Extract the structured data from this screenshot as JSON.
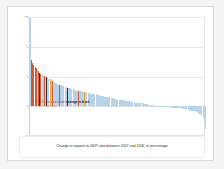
{
  "slide": {
    "background_color": "#f4f4f4",
    "card_background": "#ffffff",
    "card_border_color": "#d9d9d9"
  },
  "legend": {
    "line1_prefix": "EU11 countries in ",
    "line1_red": "red",
    "line1_mid": ", ",
    "line1_black": "average in black",
    "line2": "EU c. in orange",
    "red_color": "#c0392b",
    "black_color": "#1a1a1a",
    "orange_color": "#e8a33d"
  },
  "caption": {
    "text": "Change in exports to GDP ratio between 2017 and 2000, in percentage"
  },
  "chart_data": {
    "type": "bar",
    "title": "",
    "subtitle": "",
    "xlabel": "",
    "ylabel": "",
    "ylim": [
      -40,
      120
    ],
    "yticks": [
      120,
      80,
      40,
      0,
      -40
    ],
    "ytick_labels": [
      "120",
      "80",
      "40",
      "0",
      "-40"
    ],
    "grid": true,
    "grid_axis": "y",
    "legend_position": "inside-left",
    "sorted": "descending",
    "note": "Sorted change in exports-to-GDP ratio across ~150 economies; EU11 highlighted red, EU average black, EU candidate orange, all other economies light blue.",
    "colors": {
      "other": "#b8d2ea",
      "eu11": "#cf5b3a",
      "average": "#333333",
      "candidate": "#e8a33d"
    },
    "series": [
      {
        "name": "Change in exports to GDP ratio 2000-2017",
        "categories": [
          "c1",
          "c2",
          "c3",
          "c4",
          "c5",
          "c6",
          "c7",
          "c8",
          "c9",
          "c10",
          "c11",
          "c12",
          "c13",
          "c14",
          "c15",
          "c16",
          "c17",
          "c18",
          "c19",
          "c20",
          "c21",
          "c22",
          "c23",
          "c24",
          "c25",
          "c26",
          "c27",
          "c28",
          "c29",
          "c30",
          "c31",
          "c32",
          "c33",
          "c34",
          "c35",
          "c36",
          "c37",
          "c38",
          "c39",
          "c40",
          "c41",
          "c42",
          "c43",
          "c44",
          "c45",
          "c46",
          "c47",
          "c48",
          "c49",
          "c50",
          "c51",
          "c52",
          "c53",
          "c54",
          "c55",
          "c56",
          "c57",
          "c58",
          "c59",
          "c60",
          "c61",
          "c62",
          "c63",
          "c64",
          "c65",
          "c66",
          "c67",
          "c68",
          "c69",
          "c70",
          "c71",
          "c72",
          "c73",
          "c74",
          "c75",
          "c76",
          "c77",
          "c78",
          "c79",
          "c80",
          "c81",
          "c82",
          "c83",
          "c84",
          "c85",
          "c86",
          "c87",
          "c88",
          "c89",
          "c90",
          "c91",
          "c92",
          "c93",
          "c94",
          "c95",
          "c96",
          "c97",
          "c98",
          "c99",
          "c100",
          "c101",
          "c102",
          "c103",
          "c104",
          "c105",
          "c106",
          "c107",
          "c108",
          "c109",
          "c110",
          "c111",
          "c112",
          "c113",
          "c114",
          "c115",
          "c116",
          "c117",
          "c118",
          "c119",
          "c120",
          "c121",
          "c122",
          "c123",
          "c124",
          "c125",
          "c126",
          "c127",
          "c128",
          "c129",
          "c130",
          "c131",
          "c132",
          "c133",
          "c134",
          "c135",
          "c136",
          "c137",
          "c138",
          "c139",
          "c140",
          "c141",
          "c142",
          "c143",
          "c144",
          "c145",
          "c146",
          "c147",
          "c148",
          "c149",
          "c150"
        ],
        "values": [
          118,
          62,
          58,
          55,
          53,
          51,
          49,
          47,
          45,
          44,
          43,
          42,
          41,
          40,
          39,
          38,
          37,
          36,
          35,
          34,
          33,
          32,
          31,
          30,
          29,
          29,
          28,
          28,
          27,
          27,
          26,
          26,
          25,
          25,
          24,
          24,
          23,
          23,
          22,
          22,
          21,
          21,
          21,
          20,
          20,
          20,
          19,
          19,
          19,
          18,
          18,
          18,
          17,
          17,
          17,
          16,
          16,
          16,
          15,
          15,
          15,
          14,
          14,
          14,
          13,
          13,
          13,
          12,
          12,
          12,
          11,
          11,
          11,
          10,
          10,
          10,
          9,
          9,
          9,
          8,
          8,
          8,
          8,
          7,
          7,
          7,
          7,
          6,
          6,
          6,
          6,
          5,
          5,
          5,
          5,
          4,
          4,
          4,
          4,
          3,
          3,
          3,
          3,
          2,
          2,
          2,
          2,
          2,
          1,
          1,
          1,
          1,
          1,
          0,
          0,
          0,
          0,
          0,
          -1,
          -1,
          -1,
          -1,
          -1,
          -2,
          -2,
          -2,
          -2,
          -2,
          -3,
          -3,
          -3,
          -3,
          -4,
          -4,
          -4,
          -4,
          -5,
          -5,
          -5,
          -6,
          -6,
          -6,
          -7,
          -7,
          -8,
          -8,
          -9,
          -10,
          -11,
          -13,
          -16,
          -21,
          -30
        ],
        "kinds": [
          "other",
          "eu11",
          "eu11",
          "eu11",
          "eu11",
          "eu11",
          "other",
          "eu11",
          "average",
          "eu11",
          "other",
          "other",
          "eu11",
          "other",
          "average",
          "other",
          "other",
          "candidate",
          "other",
          "eu11",
          "other",
          "other",
          "other",
          "other",
          "other",
          "eu11",
          "other",
          "other",
          "other",
          "other",
          "other",
          "other",
          "average",
          "other",
          "other",
          "other",
          "other",
          "other",
          "other",
          "other",
          "other",
          "other",
          "eu11",
          "other",
          "other",
          "other",
          "other",
          "candidate",
          "other",
          "other",
          "other",
          "other",
          "other",
          "other",
          "other",
          "other",
          "other",
          "other",
          "other",
          "other",
          "other",
          "other",
          "other",
          "other",
          "other",
          "other",
          "other",
          "other",
          "other",
          "other",
          "other",
          "other",
          "other",
          "other",
          "other",
          "other",
          "other",
          "other",
          "other",
          "other",
          "other",
          "other",
          "other",
          "other",
          "other",
          "other",
          "other",
          "other",
          "other",
          "other",
          "other",
          "other",
          "other",
          "other",
          "other",
          "other",
          "other",
          "other",
          "other",
          "other",
          "other",
          "other",
          "other",
          "other",
          "other",
          "other",
          "other",
          "other",
          "other",
          "other",
          "other",
          "other",
          "other",
          "other",
          "other",
          "other",
          "other",
          "other",
          "other",
          "other",
          "other",
          "other",
          "other",
          "other",
          "other",
          "other",
          "other",
          "other",
          "other",
          "other",
          "other",
          "other",
          "other",
          "other",
          "other",
          "other",
          "other",
          "other",
          "other",
          "other",
          "other",
          "other",
          "other",
          "other",
          "other",
          "other",
          "other",
          "other",
          "other",
          "other"
        ]
      }
    ]
  }
}
